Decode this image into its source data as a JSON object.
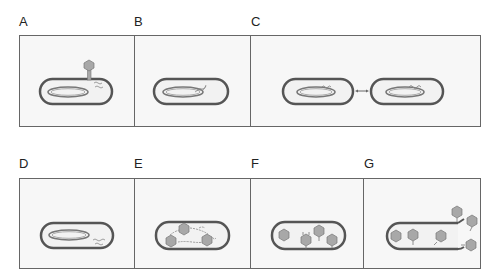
{
  "figure": {
    "rows": [
      {
        "panels": [
          {
            "label": "A",
            "stage": "attachment-and-injection"
          },
          {
            "label": "B",
            "stage": "integration-of-phage-dna"
          },
          {
            "label": "C",
            "stage": "cell-division-prophage-replication"
          }
        ]
      },
      {
        "panels": [
          {
            "label": "D",
            "stage": "excision-of-phage-dna"
          },
          {
            "label": "E",
            "stage": "synthesis-of-phage-components"
          },
          {
            "label": "F",
            "stage": "assembly-of-phages"
          },
          {
            "label": "G",
            "stage": "lysis-and-release"
          }
        ]
      }
    ]
  },
  "colors": {
    "cell_wall": "#555555",
    "cell_fill": "#f2f2f2",
    "panel_border": "#666666",
    "panel_fill": "#f7f7f7",
    "phage_fill": "#a8a8a8",
    "dna": "#888888"
  }
}
